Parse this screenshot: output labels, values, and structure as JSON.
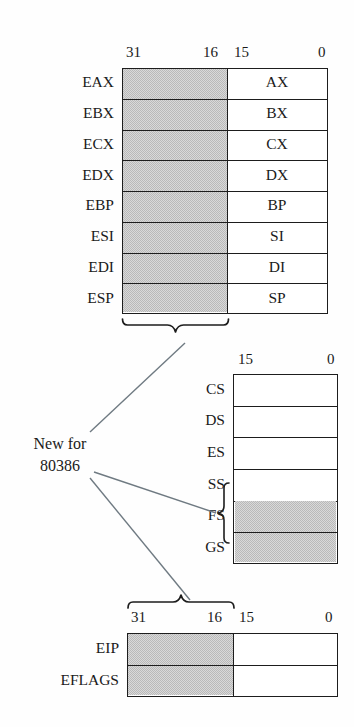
{
  "figure": {
    "gray_color": "#b9b9b9",
    "line_color": "#1d1d1d",
    "background": "#fefefe"
  },
  "general_registers": {
    "bit_labels": {
      "high_left": "31",
      "high_right": "16",
      "low_left": "15",
      "low_right": "0"
    },
    "rows": [
      {
        "ext_name": "EAX",
        "low_name": "AX",
        "high_shaded": true
      },
      {
        "ext_name": "EBX",
        "low_name": "BX",
        "high_shaded": true
      },
      {
        "ext_name": "ECX",
        "low_name": "CX",
        "high_shaded": true
      },
      {
        "ext_name": "EDX",
        "low_name": "DX",
        "high_shaded": true
      },
      {
        "ext_name": "EBP",
        "low_name": "BP",
        "high_shaded": true
      },
      {
        "ext_name": "ESI",
        "low_name": "SI",
        "high_shaded": true
      },
      {
        "ext_name": "EDI",
        "low_name": "DI",
        "high_shaded": true
      },
      {
        "ext_name": "ESP",
        "low_name": "SP",
        "high_shaded": true
      }
    ]
  },
  "segment_registers": {
    "bit_labels": {
      "left": "15",
      "right": "0"
    },
    "rows": [
      {
        "name": "CS",
        "shaded": false
      },
      {
        "name": "DS",
        "shaded": false
      },
      {
        "name": "ES",
        "shaded": false
      },
      {
        "name": "SS",
        "shaded": false
      },
      {
        "name": "FS",
        "shaded": true
      },
      {
        "name": "GS",
        "shaded": true
      }
    ]
  },
  "instruction_registers": {
    "bit_labels": {
      "high_left": "31",
      "high_right": "16",
      "low_left": "15",
      "low_right": "0"
    },
    "rows": [
      {
        "name": "EIP",
        "high_shaded": true
      },
      {
        "name": "EFLAGS",
        "high_shaded": true
      }
    ]
  },
  "annotation": {
    "line1": "New for",
    "line2": "80386"
  }
}
